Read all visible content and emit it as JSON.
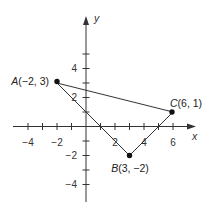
{
  "diagram": {
    "type": "coordinate-plane-triangle",
    "axes": {
      "x_label": "x",
      "y_label": "y",
      "x_tick_labels": [
        "−4",
        "−2",
        "2",
        "4",
        "6"
      ],
      "y_tick_labels": [
        "4",
        "2",
        "−2",
        "−4"
      ],
      "x_range": [
        -5,
        7
      ],
      "y_range": [
        -5,
        7
      ]
    },
    "points": [
      {
        "name": "A",
        "coords": "(−2, 3)",
        "x": -2,
        "y": 3
      },
      {
        "name": "B",
        "coords": "(3, −2)",
        "x": 3,
        "y": -2
      },
      {
        "name": "C",
        "coords": "(6, 1)",
        "x": 6,
        "y": 1
      }
    ],
    "segments": [
      [
        "A",
        "B"
      ],
      [
        "B",
        "C"
      ],
      [
        "A",
        "C"
      ]
    ],
    "colors": {
      "line": "#333333",
      "point": "#111111",
      "background": "#ffffff"
    }
  }
}
